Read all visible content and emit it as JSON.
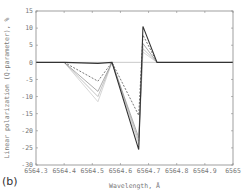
{
  "panel_label": "(b)",
  "chart_data": {
    "type": "line",
    "title": "",
    "xlabel": "Wavelength, Å",
    "ylabel": "Linear polarization (Q-parameter), %",
    "xlim": [
      6564.3,
      6565.0
    ],
    "ylim": [
      -30,
      15
    ],
    "xticks": [
      6564.3,
      6564.4,
      6564.5,
      6564.6,
      6564.7,
      6564.8,
      6564.9,
      6565
    ],
    "xtick_labels": [
      "6564.3",
      "6564.4",
      "6564.5",
      "6564.6",
      "6564.7",
      "6564.8",
      "6564.9",
      "6565"
    ],
    "yticks": [
      15,
      10,
      5,
      0,
      -5,
      -10,
      -15,
      -20,
      -25,
      -30
    ],
    "ytick_labels": [
      "15",
      "10",
      "5",
      "0",
      "-5",
      "-10",
      "-15",
      "-20",
      "-25",
      "-30"
    ],
    "grid": false,
    "legend": null,
    "zero_line": {
      "y": 0,
      "color": "#bbbbbb"
    },
    "series": [
      {
        "name": "series-1",
        "color": "#333333",
        "dash": "",
        "width": 1.1,
        "x": [
          6564.3,
          6564.4,
          6564.52,
          6564.57,
          6564.665,
          6564.68,
          6564.73,
          6565.0
        ],
        "y": [
          0,
          0,
          -0.3,
          0,
          -25.5,
          10.5,
          0,
          0
        ]
      },
      {
        "name": "series-2",
        "color": "#555555",
        "dash": "2,1.5",
        "width": 0.8,
        "x": [
          6564.4,
          6564.52,
          6564.57,
          6564.665,
          6564.68,
          6564.73
        ],
        "y": [
          0,
          -5.5,
          0,
          -15.5,
          8,
          0
        ]
      },
      {
        "name": "series-3",
        "color": "#888888",
        "dash": "",
        "width": 0.7,
        "x": [
          6564.4,
          6564.52,
          6564.57,
          6564.665,
          6564.68,
          6564.73
        ],
        "y": [
          0,
          -8.5,
          0,
          -22,
          5.5,
          0
        ]
      },
      {
        "name": "series-4",
        "color": "#aaaaaa",
        "dash": "",
        "width": 0.7,
        "x": [
          6564.4,
          6564.52,
          6564.57,
          6564.665,
          6564.68,
          6564.73
        ],
        "y": [
          0,
          -10,
          0,
          -23,
          4,
          0
        ]
      },
      {
        "name": "series-5",
        "color": "#c4c4c4",
        "dash": "",
        "width": 0.7,
        "x": [
          6564.4,
          6564.52,
          6564.57,
          6564.665,
          6564.68,
          6564.73
        ],
        "y": [
          0,
          -11.5,
          0,
          -24,
          3,
          0
        ]
      }
    ]
  }
}
